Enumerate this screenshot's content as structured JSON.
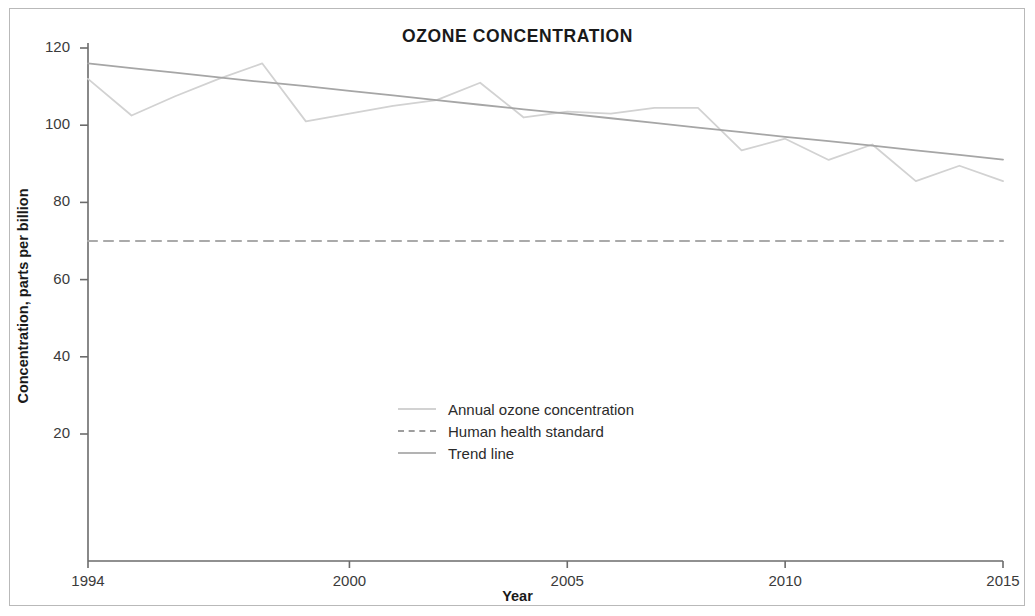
{
  "chart_data": {
    "type": "line",
    "title": "OZONE CONCENTRATION",
    "xlabel": "Year",
    "ylabel": "Concentration, parts per billion",
    "xlim": [
      1994,
      2015
    ],
    "ylim": [
      0,
      120
    ],
    "grid": false,
    "legend_position": "center",
    "xticks": [
      "1994",
      "2000",
      "2005",
      "2010",
      "2015"
    ],
    "xtick_values": [
      1994,
      2000,
      2005,
      2010,
      2015
    ],
    "yticks": [
      "20",
      "40",
      "60",
      "80",
      "100",
      "120"
    ],
    "ytick_values": [
      20,
      40,
      60,
      80,
      100,
      120
    ],
    "x": [
      1994,
      1995,
      1996,
      1997,
      1998,
      1999,
      2000,
      2001,
      2002,
      2003,
      2004,
      2005,
      2006,
      2007,
      2008,
      2009,
      2010,
      2011,
      2012,
      2013,
      2014,
      2015
    ],
    "series": [
      {
        "name": "Annual ozone concentration",
        "style": "solid",
        "color": "#d2d2d2",
        "values": [
          112.0,
          102.5,
          107.5,
          112.0,
          116.0,
          101.0,
          103.0,
          105.0,
          106.5,
          111.0,
          102.0,
          103.5,
          103.0,
          104.5,
          104.5,
          93.5,
          96.5,
          91.0,
          95.0,
          85.5,
          89.5,
          85.5
        ]
      },
      {
        "name": "Human health standard",
        "style": "dashed",
        "color": "#aaaaaa",
        "constant_value": 70,
        "values": [
          70,
          70,
          70,
          70,
          70,
          70,
          70,
          70,
          70,
          70,
          70,
          70,
          70,
          70,
          70,
          70,
          70,
          70,
          70,
          70,
          70,
          70
        ]
      },
      {
        "name": "Trend line",
        "style": "solid",
        "color": "#a6a6a6",
        "values": [
          116.0,
          114.8,
          113.6,
          112.4,
          111.2,
          110.1,
          108.9,
          107.7,
          106.5,
          105.3,
          104.1,
          103.0,
          101.8,
          100.6,
          99.4,
          98.2,
          97.0,
          95.9,
          94.7,
          93.5,
          92.3,
          91.1
        ]
      }
    ]
  },
  "legend": {
    "items": [
      {
        "label": "Annual ozone concentration"
      },
      {
        "label": "Human health standard"
      },
      {
        "label": "Trend line"
      }
    ]
  }
}
